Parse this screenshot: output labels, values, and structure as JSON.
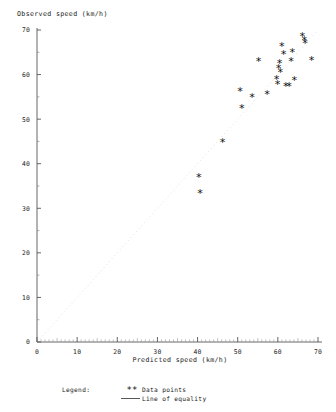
{
  "chart_data": {
    "type": "scatter",
    "title": "",
    "xlabel": "Predicted speed (km/h)",
    "ylabel": "Observed speed (km/h)",
    "xlim": [
      0,
      70
    ],
    "ylim": [
      0,
      70
    ],
    "xticks": [
      0,
      10,
      20,
      30,
      40,
      50,
      60,
      70
    ],
    "yticks": [
      0,
      10,
      20,
      30,
      40,
      50,
      60,
      70
    ],
    "xticklabels": [
      "0",
      "10",
      "20",
      "30",
      "40",
      "50",
      "60",
      "70"
    ],
    "yticklabels": [
      "0",
      "10",
      "20",
      "30",
      "40",
      "50",
      "60",
      "70"
    ],
    "minor_tick_step": 5,
    "grid": false,
    "marker": "*",
    "marker_color": "#111111",
    "legend_position": "below-axes",
    "series": [
      {
        "name": "Data points",
        "marker": "*",
        "points": [
          [
            40.3,
            37.0
          ],
          [
            40.6,
            33.4
          ],
          [
            46.2,
            44.8
          ],
          [
            50.6,
            56.2
          ],
          [
            51.0,
            52.4
          ],
          [
            53.6,
            54.9
          ],
          [
            55.2,
            63.0
          ],
          [
            57.3,
            55.5
          ],
          [
            59.7,
            59.0
          ],
          [
            59.9,
            57.8
          ],
          [
            60.2,
            61.4
          ],
          [
            60.4,
            62.4
          ],
          [
            60.6,
            60.4
          ],
          [
            61.0,
            66.2
          ],
          [
            61.4,
            64.5
          ],
          [
            62.0,
            57.3
          ],
          [
            62.8,
            57.3
          ],
          [
            63.3,
            62.9
          ],
          [
            63.6,
            65.0
          ],
          [
            64.1,
            58.6
          ],
          [
            66.1,
            68.6
          ],
          [
            66.6,
            67.6
          ],
          [
            66.8,
            67.0
          ],
          [
            68.4,
            63.2
          ]
        ]
      }
    ],
    "reference_line": {
      "name": "Line of equality",
      "from": [
        0,
        0
      ],
      "to": [
        70,
        70
      ],
      "style": "dotted",
      "color": "#d8d8d8"
    }
  },
  "axes": {
    "x_label": "Predicted speed (km/h)",
    "y_label": "Observed speed (km/h)"
  },
  "legend": {
    "heading": "Legend:",
    "items": [
      {
        "symbol": "**",
        "label": "Data points",
        "kind": "marker"
      },
      {
        "symbol": "——",
        "label": "Line of equality",
        "kind": "line"
      }
    ]
  }
}
